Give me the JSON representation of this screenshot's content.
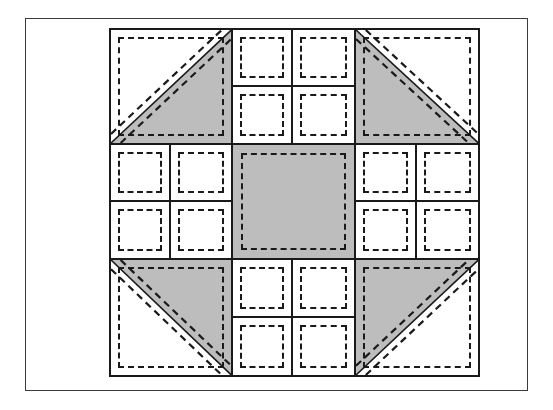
{
  "figure": {
    "name": "quilt-block-piecing-diagram",
    "kind": "line-drawing",
    "canvas": {
      "width": 553,
      "height": 410,
      "background": "#ffffff"
    },
    "frame": {
      "name": "outer-border-frame",
      "x": 25,
      "y": 18,
      "width": 503,
      "height": 373,
      "stroke": "#3b3b3b",
      "stroke_width": 1.5,
      "fill": "#ffffff"
    },
    "colors": {
      "background": "#ffffff",
      "fabric_light": "#ffffff",
      "fabric_dark": "#bdbdbd",
      "outline": "#1a1a1a",
      "seam_line": "#1a1a1a",
      "frame": "#3b3b3b"
    }
  },
  "block": {
    "name": "quilt-block",
    "x": 108,
    "y": 27,
    "width": 371,
    "height": 349,
    "grid_rows": 3,
    "grid_cols": 3,
    "outline_width": 2.5,
    "cells": [
      {
        "row": 0,
        "col": 0,
        "name": "corner-hst-top-left",
        "unit_type": "half-square-triangle",
        "diagonal": "bottom-left-to-top-right",
        "shaded_half": "lower-right",
        "shade": "#bdbdbd"
      },
      {
        "row": 0,
        "col": 1,
        "name": "four-patch-top-center",
        "unit_type": "four-patch",
        "patches": [
          "light",
          "light",
          "light",
          "light"
        ]
      },
      {
        "row": 0,
        "col": 2,
        "name": "corner-hst-top-right",
        "unit_type": "half-square-triangle",
        "diagonal": "top-left-to-bottom-right",
        "shaded_half": "lower-left",
        "shade": "#bdbdbd"
      },
      {
        "row": 1,
        "col": 0,
        "name": "four-patch-middle-left",
        "unit_type": "four-patch",
        "patches": [
          "light",
          "light",
          "light",
          "light"
        ]
      },
      {
        "row": 1,
        "col": 1,
        "name": "center-square",
        "unit_type": "solid-square",
        "shade": "#bdbdbd"
      },
      {
        "row": 1,
        "col": 2,
        "name": "four-patch-middle-right",
        "unit_type": "four-patch",
        "patches": [
          "light",
          "light",
          "light",
          "light"
        ]
      },
      {
        "row": 2,
        "col": 0,
        "name": "corner-hst-bottom-left",
        "unit_type": "half-square-triangle",
        "diagonal": "top-left-to-bottom-right",
        "shaded_half": "upper-right",
        "shade": "#bdbdbd"
      },
      {
        "row": 2,
        "col": 1,
        "name": "four-patch-bottom-center",
        "unit_type": "four-patch",
        "patches": [
          "light",
          "light",
          "light",
          "light"
        ]
      },
      {
        "row": 2,
        "col": 2,
        "name": "corner-hst-bottom-right",
        "unit_type": "half-square-triangle",
        "diagonal": "bottom-left-to-top-right",
        "shaded_half": "upper-left",
        "shade": "#bdbdbd"
      }
    ]
  }
}
